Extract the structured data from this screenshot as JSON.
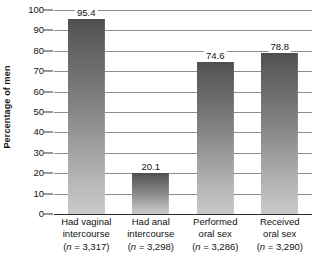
{
  "chart_data": {
    "type": "bar",
    "title": "",
    "subtitle": "",
    "xlabel": "",
    "ylabel": "Percentage of men",
    "ylim": [
      0,
      100
    ],
    "y_ticks": [
      0,
      10,
      20,
      30,
      40,
      50,
      60,
      70,
      80,
      90,
      100
    ],
    "y_tick_labels": [
      "0",
      "10",
      "20",
      "30",
      "40",
      "50",
      "60",
      "70",
      "80",
      "90",
      "100"
    ],
    "grid": "horizontal",
    "legend": "none",
    "categories": [
      "Had vaginal intercourse (n = 3,317)",
      "Had anal intercourse (n = 3,298)",
      "Performed oral sex (n = 3,286)",
      "Received oral sex (n = 3,290)"
    ],
    "values": [
      95.4,
      20.1,
      74.6,
      78.8
    ],
    "value_labels": [
      "95.4",
      "20.1",
      "74.6",
      "78.8"
    ],
    "sample_sizes": [
      3317,
      3298,
      3286,
      3290
    ],
    "bars": [
      {
        "value": 95.4,
        "value_label": "95.4",
        "label_line1": "Had vaginal",
        "label_line2": "intercourse",
        "n_prefix": "(",
        "n_symbol": "n",
        "n_suffix": " = 3,317)"
      },
      {
        "value": 20.1,
        "value_label": "20.1",
        "label_line1": "Had anal",
        "label_line2": "intercourse",
        "n_prefix": "(",
        "n_symbol": "n",
        "n_suffix": " = 3,298)"
      },
      {
        "value": 74.6,
        "value_label": "74.6",
        "label_line1": "Performed",
        "label_line2": "oral sex",
        "n_prefix": "(",
        "n_symbol": "n",
        "n_suffix": " = 3,286)"
      },
      {
        "value": 78.8,
        "value_label": "78.8",
        "label_line1": "Received",
        "label_line2": "oral sex",
        "n_prefix": "(",
        "n_symbol": "n",
        "n_suffix": " = 3,290)"
      }
    ],
    "colors": {
      "bar_gradient_top": "#4f4f4f",
      "bar_gradient_bottom": "#c9c9c9",
      "gridline": "#8d8d8d",
      "axis": "#2b2b2b",
      "text": "#111111",
      "background": "#ffffff"
    }
  }
}
